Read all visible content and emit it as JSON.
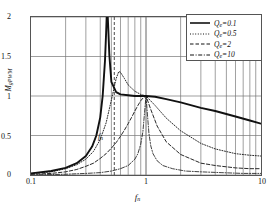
{
  "figure": {
    "xlabel": "f",
    "xlabel_sub": "n",
    "ylabel": "M",
    "ylabel_sub": "gPWM",
    "annotation": "f",
    "annotation_sub": "n"
  },
  "axes": {
    "x_ticks": [
      "0.1",
      "1",
      "10"
    ],
    "y_ticks": [
      "0",
      "0.5",
      "1",
      "1.5",
      "2"
    ]
  },
  "legend": {
    "entries": [
      {
        "label": "Q",
        "sub": "e",
        "value": "=0.1",
        "style": "solid"
      },
      {
        "label": "Q",
        "sub": "e",
        "value": "=0.5",
        "style": "dotted"
      },
      {
        "label": "Q",
        "sub": "e",
        "value": "=2",
        "style": "dashed"
      },
      {
        "label": "Q",
        "sub": "e",
        "value": "=10",
        "style": "dashdot"
      }
    ]
  },
  "chart_data": {
    "type": "line",
    "title": "",
    "xlabel": "fn",
    "ylabel": "MgPWM",
    "xscale": "log",
    "xlim": [
      0.1,
      10
    ],
    "ylim": [
      0,
      2
    ],
    "grid": true,
    "grid_x_minor": [
      0.2,
      0.3,
      0.4,
      0.5,
      0.6,
      0.7,
      0.8,
      0.9,
      2,
      3,
      4,
      5,
      6,
      7,
      8,
      9
    ],
    "grid_y": [
      0,
      0.5,
      1,
      1.5,
      2
    ],
    "legend_position": "top-right",
    "annotations": [
      {
        "text": "fn",
        "type": "vertical-dashed-line",
        "x": 0.53,
        "label_y": 0.42
      }
    ],
    "series": [
      {
        "name": "Qe=0.1",
        "style": "solid",
        "x": [
          0.1,
          0.15,
          0.2,
          0.25,
          0.3,
          0.34,
          0.37,
          0.4,
          0.42,
          0.44,
          0.45,
          0.455,
          0.46,
          0.465,
          0.47,
          0.48,
          0.5,
          0.55,
          0.6,
          0.7,
          0.8,
          0.9,
          1.0,
          1.2,
          1.5,
          2.0,
          3.0,
          4.0,
          6.0,
          8.0,
          10.0
        ],
        "values": [
          0.02,
          0.05,
          0.09,
          0.15,
          0.24,
          0.36,
          0.5,
          0.73,
          1.0,
          1.45,
          1.8,
          2.0,
          2.0,
          2.0,
          1.85,
          1.52,
          1.18,
          1.05,
          1.02,
          1.01,
          1.0,
          1.0,
          1.0,
          0.99,
          0.96,
          0.92,
          0.85,
          0.81,
          0.74,
          0.69,
          0.65
        ]
      },
      {
        "name": "Qe=0.5",
        "style": "dotted",
        "x": [
          0.1,
          0.15,
          0.2,
          0.25,
          0.3,
          0.35,
          0.4,
          0.45,
          0.5,
          0.55,
          0.58,
          0.6,
          0.65,
          0.7,
          0.8,
          0.9,
          1.0,
          1.2,
          1.5,
          2.0,
          3.0,
          4.0,
          6.0,
          8.0,
          10.0
        ],
        "values": [
          0.02,
          0.04,
          0.08,
          0.13,
          0.2,
          0.3,
          0.45,
          0.66,
          0.95,
          1.22,
          1.31,
          1.3,
          1.22,
          1.14,
          1.06,
          1.02,
          1.0,
          0.88,
          0.72,
          0.56,
          0.4,
          0.33,
          0.27,
          0.25,
          0.24
        ]
      },
      {
        "name": "Qe=2",
        "style": "dashed",
        "x": [
          0.1,
          0.15,
          0.2,
          0.25,
          0.3,
          0.35,
          0.4,
          0.45,
          0.5,
          0.55,
          0.6,
          0.65,
          0.7,
          0.75,
          0.8,
          0.85,
          0.9,
          0.95,
          1.0,
          1.1,
          1.25,
          1.5,
          2.0,
          3.0,
          4.0,
          6.0,
          8.0,
          10.0
        ],
        "values": [
          0.01,
          0.02,
          0.04,
          0.07,
          0.11,
          0.15,
          0.21,
          0.27,
          0.34,
          0.41,
          0.49,
          0.57,
          0.65,
          0.73,
          0.81,
          0.88,
          0.94,
          0.98,
          1.0,
          0.83,
          0.62,
          0.42,
          0.26,
          0.15,
          0.12,
          0.09,
          0.08,
          0.08
        ]
      },
      {
        "name": "Qe=10",
        "style": "dashdot",
        "x": [
          0.1,
          0.2,
          0.3,
          0.4,
          0.5,
          0.6,
          0.7,
          0.8,
          0.85,
          0.9,
          0.94,
          0.97,
          1.0,
          1.03,
          1.06,
          1.1,
          1.15,
          1.25,
          1.4,
          1.7,
          2.2,
          3.0,
          4.5,
          7.0,
          10.0
        ],
        "values": [
          0.0,
          0.01,
          0.02,
          0.03,
          0.05,
          0.08,
          0.12,
          0.2,
          0.27,
          0.39,
          0.55,
          0.78,
          1.0,
          0.76,
          0.53,
          0.37,
          0.27,
          0.18,
          0.12,
          0.08,
          0.05,
          0.04,
          0.03,
          0.02,
          0.02
        ]
      }
    ]
  }
}
